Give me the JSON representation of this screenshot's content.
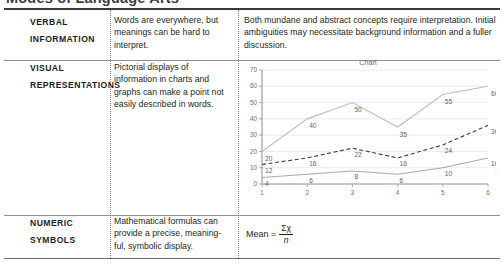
{
  "heading": {
    "cut_off_text": "Modes of Language Arts"
  },
  "table": {
    "rows": [
      {
        "label_line1": "VERBAL",
        "label_line2": "INFORMATION",
        "description": "Words are everywhere, but meanings can be hard to interpret.",
        "example_text": "Both mundane and abstract concepts require interpretation. Initial ambiguities may necessitate background information and a fuller discussion."
      },
      {
        "label_line1": "VISUAL",
        "label_line2": "REPRESENTATIONS",
        "description": "Pictorial displays of information in charts and graphs can make a point not easily described in words."
      },
      {
        "label_line1": "NUMERIC",
        "label_line2": "SYMBOLS",
        "description": "Mathematical formulas can provide a precise, meaning-ful, symbolic display."
      }
    ]
  },
  "formula": {
    "lead": "Mean =",
    "numerator": "Σχ",
    "denominator": "n"
  },
  "watermark": {
    "text": "|||"
  },
  "chart_data": {
    "type": "line",
    "title": "Chart",
    "xlabel": "",
    "ylabel": "",
    "x": [
      1,
      2,
      3,
      4,
      5,
      6
    ],
    "categories": [
      "1",
      "2",
      "3",
      "4",
      "5",
      "6"
    ],
    "xticks": [
      "1",
      "2",
      "3",
      "4",
      "5",
      "6"
    ],
    "yticks": [
      "0",
      "10",
      "20",
      "30",
      "40",
      "50",
      "60",
      "70"
    ],
    "ylim": [
      0,
      70
    ],
    "xlim": [
      1,
      6
    ],
    "grid": true,
    "legend": "none",
    "series": [
      {
        "name": "Series 1",
        "style": "solid",
        "color": "#bdbdbd",
        "values": [
          20,
          40,
          50,
          35,
          55,
          60
        ],
        "labels": [
          "20",
          "40",
          "50",
          "35",
          "55",
          "60"
        ]
      },
      {
        "name": "Series 2",
        "style": "dashed",
        "color": "#3c3c3c",
        "values": [
          12,
          16,
          22,
          16,
          24,
          36
        ],
        "labels": [
          "12",
          "16",
          "22",
          "16",
          "24",
          "36"
        ]
      },
      {
        "name": "Series 3",
        "style": "solid",
        "color": "#a8a8a8",
        "values": [
          4,
          6,
          8,
          6,
          10,
          16
        ],
        "labels": [
          "4",
          "6",
          "8",
          "6",
          "10",
          "16"
        ]
      }
    ]
  }
}
